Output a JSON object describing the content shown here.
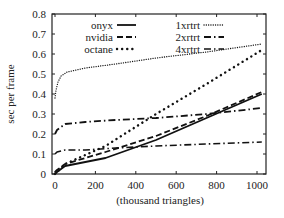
{
  "chart_data": {
    "type": "line",
    "title": "",
    "xlabel": "(thousand triangles)",
    "ylabel": "sec per frame",
    "xlim": [
      -20,
      1040
    ],
    "ylim": [
      0,
      0.8
    ],
    "xticks": [
      0,
      200,
      400,
      600,
      800,
      1000
    ],
    "yticks": [
      0,
      0.1,
      0.2,
      0.3,
      0.4,
      0.5,
      0.6,
      0.7,
      0.8
    ],
    "xtick_labels": [
      "0",
      "200",
      "400",
      "600",
      "800",
      "1000"
    ],
    "ytick_labels": [
      "0",
      "0.1",
      "0.2",
      "0.3",
      "0.4",
      "0.5",
      "0.6",
      "0.7",
      "0.8"
    ],
    "grid": false,
    "legend_position": "top-left (inside, two columns)",
    "series": [
      {
        "name": "onyx",
        "style": "solid",
        "x": [
          0,
          10,
          50,
          250,
          500,
          750,
          1024
        ],
        "y": [
          0.0,
          0.01,
          0.04,
          0.08,
          0.17,
          0.28,
          0.4
        ]
      },
      {
        "name": "nvidia",
        "style": "dashed",
        "x": [
          0,
          10,
          50,
          250,
          500,
          750,
          1024
        ],
        "y": [
          0.01,
          0.02,
          0.05,
          0.11,
          0.19,
          0.29,
          0.41
        ]
      },
      {
        "name": "octane",
        "style": "dotted-coarse",
        "x": [
          0,
          10,
          50,
          250,
          500,
          750,
          1024
        ],
        "y": [
          0.0,
          0.01,
          0.05,
          0.14,
          0.3,
          0.45,
          0.62
        ]
      },
      {
        "name": "1xrtrt",
        "style": "dotted-fine",
        "x": [
          0,
          5,
          15,
          30,
          60,
          150,
          300,
          500,
          750,
          1024
        ],
        "y": [
          0.38,
          0.42,
          0.46,
          0.49,
          0.51,
          0.53,
          0.55,
          0.58,
          0.61,
          0.65
        ]
      },
      {
        "name": "2xrtrt",
        "style": "dash-dot",
        "x": [
          0,
          10,
          50,
          150,
          300,
          500,
          750,
          1024
        ],
        "y": [
          0.2,
          0.22,
          0.25,
          0.26,
          0.27,
          0.28,
          0.3,
          0.33
        ]
      },
      {
        "name": "4xrtrt",
        "style": "dash-dot-dot",
        "x": [
          0,
          10,
          50,
          150,
          300,
          500,
          750,
          1024
        ],
        "y": [
          0.1,
          0.11,
          0.12,
          0.12,
          0.13,
          0.14,
          0.15,
          0.16
        ]
      }
    ]
  }
}
